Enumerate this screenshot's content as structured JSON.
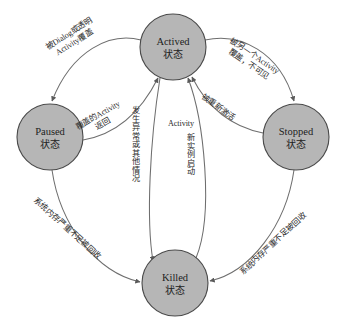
{
  "diagram": {
    "colors": {
      "node_fill": "#b6b6b6",
      "node_stroke": "#4a4a4a",
      "edge_stroke": "#6e6e6e",
      "text": "#1d1d1d",
      "background": "#ffffff"
    },
    "nodes": [
      {
        "id": "actived",
        "label_en": "Actived",
        "label_cn": "状态",
        "cx": 173,
        "cy": 47,
        "r": 33
      },
      {
        "id": "paused",
        "label_en": "Paused",
        "label_cn": "状态",
        "cx": 50,
        "cy": 137,
        "r": 33
      },
      {
        "id": "stopped",
        "label_en": "Stopped",
        "label_cn": "状态",
        "cx": 296,
        "cy": 137,
        "r": 33
      },
      {
        "id": "killed",
        "label_en": "Killed",
        "label_cn": "状态",
        "cx": 175,
        "cy": 283,
        "r": 33
      }
    ],
    "edges": [
      {
        "id": "actived-to-paused",
        "from": "actived",
        "to": "paused",
        "label_lines": [
          "被Dialog或透明",
          "Activity覆盖"
        ],
        "orientation": "rotated"
      },
      {
        "id": "paused-to-actived",
        "from": "paused",
        "to": "actived",
        "label_lines": [
          "覆盖的Activity",
          "返回"
        ],
        "orientation": "rotated"
      },
      {
        "id": "actived-to-stopped",
        "from": "actived",
        "to": "stopped",
        "label_lines": [
          "被另一个Activity",
          "覆盖，不可见"
        ],
        "orientation": "rotated"
      },
      {
        "id": "stopped-to-actived",
        "from": "stopped",
        "to": "actived",
        "label_lines": [
          "被重新激活"
        ],
        "orientation": "rotated"
      },
      {
        "id": "actived-to-killed",
        "from": "actived",
        "to": "killed",
        "label_lines": [
          "发生异常或其他情况"
        ],
        "orientation": "vertical"
      },
      {
        "id": "killed-to-actived",
        "from": "killed",
        "to": "actived",
        "label_lines": [
          "Activity",
          "新实例启动"
        ],
        "orientation": "vertical"
      },
      {
        "id": "paused-to-killed",
        "from": "paused",
        "to": "killed",
        "label_lines": [
          "系统内存严重不足被回收"
        ],
        "orientation": "rotated"
      },
      {
        "id": "stopped-to-killed",
        "from": "stopped",
        "to": "killed",
        "label_lines": [
          "系统内存严重不足被回收"
        ],
        "orientation": "rotated"
      }
    ]
  }
}
